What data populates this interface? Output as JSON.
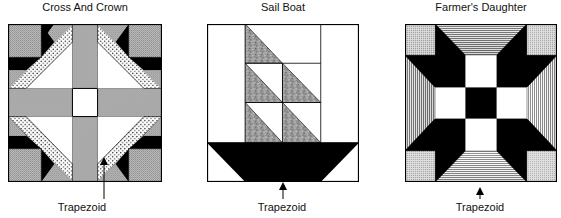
{
  "figure": {
    "blocks": [
      {
        "title": "Cross And Crown",
        "label": "Trapezoid"
      },
      {
        "title": "Sail Boat",
        "label": "Trapezoid"
      },
      {
        "title": "Farmer's Daughter",
        "label": "Trapezoid"
      }
    ]
  },
  "colors": {
    "black": "#000000",
    "gray_fill": "#b4b4b4",
    "white": "#ffffff",
    "outline": "#000000"
  }
}
